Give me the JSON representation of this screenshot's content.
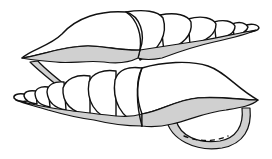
{
  "illustration": {
    "subject": "two spiral seashells (line drawing)",
    "colors": {
      "background": "#ffffff",
      "outline": "#111111",
      "shell_fill": "#ffffff",
      "shade_fill": "#d0d0d0"
    },
    "shells": [
      {
        "name": "top-shell",
        "orientation": "spire-right"
      },
      {
        "name": "bottom-shell",
        "orientation": "spire-left"
      }
    ]
  }
}
